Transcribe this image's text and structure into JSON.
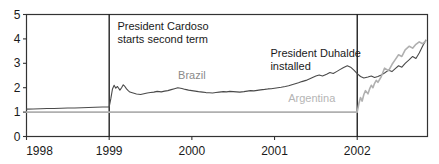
{
  "chart_data": {
    "type": "line",
    "title": "",
    "xlabel": "",
    "ylabel": "",
    "xlim": [
      1998.0,
      2002.85
    ],
    "ylim": [
      0,
      5
    ],
    "grid": false,
    "legend_position": "inline-labels",
    "xticks": [
      "1998",
      "1999",
      "2000",
      "2001",
      "2002"
    ],
    "xtick_values": [
      1998,
      1999,
      2000,
      2001,
      2002
    ],
    "yticks": [
      "0",
      "1",
      "2",
      "3",
      "4",
      "5"
    ],
    "ytick_values": [
      0,
      1,
      2,
      3,
      4,
      5
    ],
    "colors": {
      "brazil": "#4a4a4a",
      "argentina": "#b0b0b0",
      "axis": "#333333",
      "event_line": "#111111"
    },
    "annotations": [
      {
        "name": "cardoso",
        "text_line1": "President Cardoso",
        "text_line2": "starts second term",
        "x": 1999.0,
        "label_x": 1999.1
      },
      {
        "name": "duhalde",
        "text_line1": "President Duhalde",
        "text_line2": "installed",
        "x": 2002.0,
        "label_x": 2000.95
      }
    ],
    "event_lines": [
      {
        "name": "cardoso-line",
        "x": 1999.0,
        "label": "President Cardoso starts second term"
      },
      {
        "name": "duhalde-line",
        "x": 2002.0,
        "label": "President Duhalde installed"
      }
    ],
    "series": [
      {
        "name": "Brazil",
        "label": "Brazil",
        "label_x": 2000.0,
        "label_y": 2.35,
        "color": "#4a4a4a",
        "x": [
          1998.0,
          1998.08,
          1998.17,
          1998.25,
          1998.33,
          1998.42,
          1998.5,
          1998.58,
          1998.67,
          1998.75,
          1998.83,
          1998.92,
          1999.0,
          1999.02,
          1999.04,
          1999.06,
          1999.08,
          1999.1,
          1999.13,
          1999.15,
          1999.17,
          1999.19,
          1999.21,
          1999.23,
          1999.25,
          1999.29,
          1999.33,
          1999.38,
          1999.42,
          1999.46,
          1999.5,
          1999.54,
          1999.58,
          1999.63,
          1999.67,
          1999.71,
          1999.75,
          1999.79,
          1999.83,
          1999.88,
          1999.92,
          1999.96,
          2000.0,
          2000.04,
          2000.08,
          2000.13,
          2000.17,
          2000.21,
          2000.25,
          2000.29,
          2000.33,
          2000.38,
          2000.42,
          2000.46,
          2000.5,
          2000.54,
          2000.58,
          2000.63,
          2000.67,
          2000.71,
          2000.75,
          2000.79,
          2000.83,
          2000.88,
          2000.92,
          2000.96,
          2001.0,
          2001.04,
          2001.08,
          2001.13,
          2001.17,
          2001.21,
          2001.25,
          2001.29,
          2001.33,
          2001.38,
          2001.42,
          2001.46,
          2001.5,
          2001.54,
          2001.58,
          2001.63,
          2001.67,
          2001.71,
          2001.75,
          2001.79,
          2001.83,
          2001.88,
          2001.92,
          2001.96,
          2002.0,
          2002.04,
          2002.08,
          2002.13,
          2002.17,
          2002.21,
          2002.25,
          2002.29,
          2002.33,
          2002.38,
          2002.42,
          2002.46,
          2002.5,
          2002.54,
          2002.58,
          2002.63,
          2002.67,
          2002.71,
          2002.75,
          2002.79,
          2002.83
        ],
        "y": [
          1.12,
          1.13,
          1.14,
          1.15,
          1.15,
          1.16,
          1.17,
          1.17,
          1.18,
          1.19,
          1.2,
          1.21,
          1.21,
          1.55,
          1.95,
          2.1,
          1.98,
          2.05,
          1.9,
          2.0,
          2.12,
          2.05,
          1.95,
          1.88,
          1.82,
          1.78,
          1.74,
          1.72,
          1.75,
          1.78,
          1.8,
          1.82,
          1.85,
          1.83,
          1.86,
          1.88,
          1.92,
          1.96,
          2.0,
          1.97,
          1.93,
          1.9,
          1.88,
          1.86,
          1.84,
          1.82,
          1.8,
          1.79,
          1.78,
          1.8,
          1.82,
          1.84,
          1.83,
          1.85,
          1.84,
          1.83,
          1.82,
          1.84,
          1.86,
          1.88,
          1.87,
          1.89,
          1.91,
          1.93,
          1.95,
          1.96,
          1.98,
          2.0,
          2.02,
          2.05,
          2.08,
          2.12,
          2.16,
          2.2,
          2.25,
          2.3,
          2.36,
          2.42,
          2.48,
          2.52,
          2.48,
          2.55,
          2.62,
          2.58,
          2.66,
          2.74,
          2.82,
          2.9,
          2.84,
          2.72,
          2.58,
          2.46,
          2.4,
          2.44,
          2.48,
          2.42,
          2.46,
          2.52,
          2.6,
          2.72,
          2.66,
          2.78,
          2.9,
          2.84,
          3.0,
          3.15,
          3.28,
          3.2,
          3.42,
          3.7,
          3.95
        ],
        "description": "Brazilian real per US dollar, rises sharply after Jan 1999 float"
      },
      {
        "name": "Argentina",
        "label": "Argentina",
        "label_x": 2001.45,
        "label_y": 1.42,
        "color": "#b0b0b0",
        "x": [
          1998.0,
          1998.5,
          1999.0,
          1999.5,
          2000.0,
          2000.5,
          2001.0,
          2001.5,
          2001.92,
          2002.0,
          2002.02,
          2002.04,
          2002.06,
          2002.08,
          2002.1,
          2002.13,
          2002.15,
          2002.17,
          2002.19,
          2002.21,
          2002.23,
          2002.25,
          2002.29,
          2002.33,
          2002.38,
          2002.42,
          2002.46,
          2002.5,
          2002.54,
          2002.58,
          2002.63,
          2002.67,
          2002.71,
          2002.75,
          2002.79,
          2002.83
        ],
        "y": [
          1.0,
          1.0,
          1.0,
          1.0,
          1.0,
          1.0,
          1.0,
          1.0,
          1.0,
          1.0,
          1.35,
          1.6,
          1.45,
          1.72,
          1.88,
          1.75,
          1.95,
          2.1,
          2.0,
          2.18,
          2.3,
          2.22,
          2.45,
          2.8,
          2.7,
          2.95,
          3.15,
          3.35,
          3.28,
          3.55,
          3.7,
          3.62,
          3.78,
          3.88,
          3.8,
          3.92
        ],
        "description": "Argentine peso per US dollar, pegged at 1 until Jan 2002 devaluation"
      }
    ]
  }
}
